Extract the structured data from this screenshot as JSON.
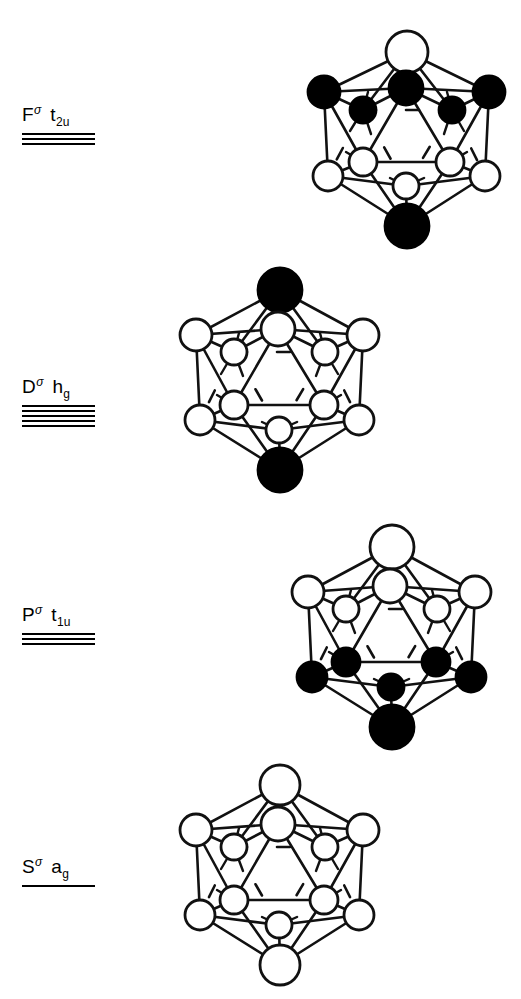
{
  "figure": {
    "background_color": "#ffffff",
    "ink_color": "#000000",
    "node_open_color": "#ffffff",
    "node_filled_color": "#000000"
  },
  "levels": [
    {
      "key": "F",
      "shell": "F",
      "superscript": "σ",
      "term": "t",
      "term_sub": "2u",
      "degeneracy": 3,
      "lines": [
        1,
        2,
        3
      ]
    },
    {
      "key": "D",
      "shell": "D",
      "superscript": "σ",
      "term": "h",
      "term_sub": "g",
      "degeneracy": 5,
      "lines": [
        1,
        2,
        3,
        4,
        5
      ]
    },
    {
      "key": "P",
      "shell": "P",
      "superscript": "σ",
      "term": "t",
      "term_sub": "1u",
      "degeneracy": 3,
      "lines": [
        1,
        2,
        3
      ]
    },
    {
      "key": "S",
      "shell": "S",
      "superscript": "σ",
      "term": "a",
      "term_sub": "g",
      "degeneracy": 1,
      "lines": [
        1
      ]
    }
  ],
  "clusters": [
    {
      "key": "F",
      "geometry": "icosahedron",
      "vertex_count": 12,
      "phases": {
        "top_apex": "open",
        "upper_ring": [
          "filled",
          "filled",
          "filled",
          "filled",
          "filled"
        ],
        "lower_ring": [
          "open",
          "open",
          "open",
          "open",
          "open"
        ],
        "bottom_apex": "filled"
      }
    },
    {
      "key": "D",
      "geometry": "icosahedron",
      "vertex_count": 12,
      "phases": {
        "top_apex": "filled",
        "upper_ring": [
          "open",
          "open",
          "open",
          "open",
          "open"
        ],
        "lower_ring": [
          "open",
          "open",
          "open",
          "open",
          "open"
        ],
        "bottom_apex": "filled"
      }
    },
    {
      "key": "P",
      "geometry": "icosahedron",
      "vertex_count": 12,
      "phases": {
        "top_apex": "open",
        "upper_ring": [
          "open",
          "open",
          "open",
          "open",
          "open"
        ],
        "lower_ring": [
          "filled",
          "filled",
          "filled",
          "filled",
          "filled"
        ],
        "bottom_apex": "filled"
      }
    },
    {
      "key": "S",
      "geometry": "icosahedron",
      "vertex_count": 12,
      "phases": {
        "top_apex": "open",
        "upper_ring": [
          "open",
          "open",
          "open",
          "open",
          "open"
        ],
        "lower_ring": [
          "open",
          "open",
          "open",
          "open",
          "open"
        ],
        "bottom_apex": "open"
      }
    }
  ]
}
